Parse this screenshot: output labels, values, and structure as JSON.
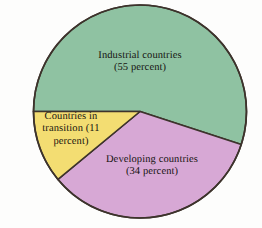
{
  "chart_data": {
    "type": "pie",
    "title": "",
    "categories": [
      "Industrial countries",
      "Developing countries",
      "Countries in transition"
    ],
    "values": [
      55,
      34,
      11
    ],
    "unit": "percent",
    "legend": "none",
    "labels_inside": true,
    "colors": [
      "#8fc2a2",
      "#d7a8d5",
      "#f3dd72"
    ],
    "outline_color": "#3d332c",
    "background": "#fdfdfc",
    "slices": [
      {
        "name": "industrial-countries",
        "label": "Industrial countries",
        "value": 55,
        "value_text": "(55 percent)",
        "color": "#8fc2a2",
        "start_angle_deg": 180,
        "end_angle_deg": 378
      },
      {
        "name": "developing-countries",
        "label": "Developing countries",
        "value": 34,
        "value_text": "(34 percent)",
        "color": "#d7a8d5",
        "start_angle_deg": 378,
        "end_angle_deg": 500.4
      },
      {
        "name": "countries-in-transition",
        "label": "Countries in transition",
        "value": 11,
        "value_text": "(11 percent)",
        "color": "#f3dd72",
        "start_angle_deg": 500.4,
        "end_angle_deg": 540
      }
    ]
  },
  "labels": {
    "industrial": "Industrial countries\n(55 percent)",
    "transition": "Countries in\ntransition (11\npercent)",
    "developing": "Developing countries\n(34 percent)"
  }
}
